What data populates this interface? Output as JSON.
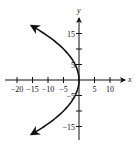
{
  "chart_data": {
    "type": "line",
    "title": "",
    "xlabel": "x",
    "ylabel": "y",
    "equation": "y^2 = -20x",
    "xlim": [
      -21,
      14
    ],
    "ylim": [
      -18,
      20
    ],
    "grid": false,
    "legend": null,
    "x_ticks": [
      -20,
      -15,
      -10,
      -5,
      5,
      10
    ],
    "x_tick_labels": [
      "−20",
      "−15",
      "−10",
      "−5",
      "5",
      "10"
    ],
    "y_ticks": [
      15,
      10,
      5,
      -5,
      -10,
      -15
    ],
    "y_tick_labels": [
      "15",
      "",
      "5",
      "−5",
      "",
      "−15"
    ],
    "series": [
      {
        "name": "parabola",
        "vertex": [
          0,
          0
        ],
        "opens": "left",
        "arrows_at_ends": true,
        "points": [
          [
            -15.3,
            17.5
          ],
          [
            -11.25,
            15
          ],
          [
            -7.8,
            12.5
          ],
          [
            -5,
            10
          ],
          [
            -2.8,
            7.5
          ],
          [
            -1.25,
            5
          ],
          [
            -0.3,
            2.5
          ],
          [
            0,
            0
          ],
          [
            -0.3,
            -2.5
          ],
          [
            -1.25,
            -5
          ],
          [
            -2.8,
            -7.5
          ],
          [
            -5,
            -10
          ],
          [
            -7.8,
            -12.5
          ],
          [
            -11.25,
            -15
          ],
          [
            -15.3,
            -17.5
          ]
        ]
      }
    ]
  },
  "labels": {
    "x_axis": "x",
    "y_axis": "y"
  }
}
